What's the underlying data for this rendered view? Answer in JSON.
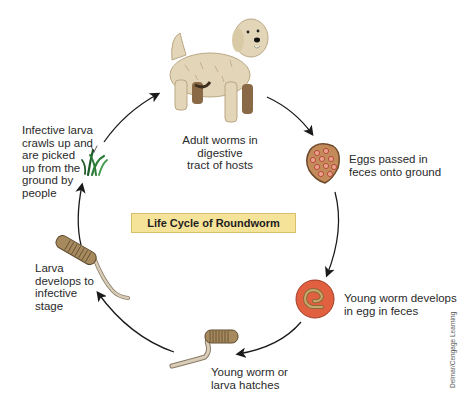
{
  "diagram": {
    "title": "Life Cycle of Roundworm",
    "credit": "Delmar/Cengage Learning",
    "stages": [
      {
        "id": "adult",
        "icon": "dog-icon",
        "label": "Adult worms in digestive\ntract of hosts"
      },
      {
        "id": "eggs",
        "icon": "feces-with-eggs-icon",
        "label": "Eggs passed in\nfeces onto ground"
      },
      {
        "id": "develop-egg",
        "icon": "egg-with-worm-icon",
        "label": "Young worm develops\nin egg in feces"
      },
      {
        "id": "hatch",
        "icon": "hatching-worm-icon",
        "label": "Young worm or\nlarva hatches"
      },
      {
        "id": "infective",
        "icon": "larva-icon",
        "label": "Larva\ndevelops to\ninfective\nstage"
      },
      {
        "id": "picked-up",
        "icon": "grass-icon",
        "label": "Infective larva\ncrawls up and\nare picked\nup from the\nground by\npeople"
      }
    ],
    "colors": {
      "title_bg": "#f6e39a",
      "egg_red": "#e0603f",
      "feces_brown": "#a8714a",
      "worm_tan": "#b59a6a",
      "grass_green": "#2e7d3a",
      "dog_fur": "#e3d6b8",
      "arrow": "#1a1a1a"
    }
  }
}
